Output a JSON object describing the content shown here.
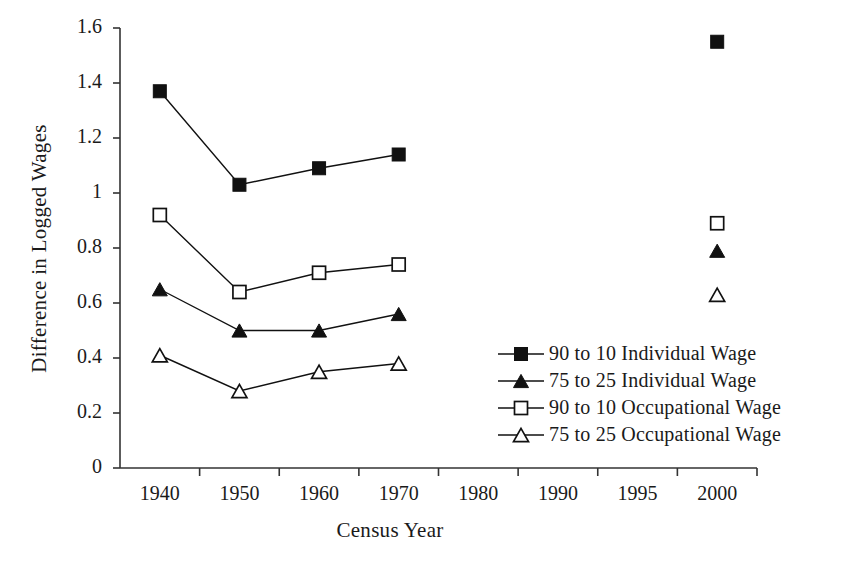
{
  "chart_data": {
    "type": "line",
    "title": "",
    "xlabel": "Census Year",
    "ylabel": "Difference in Logged Wages",
    "categories": [
      "1940",
      "1950",
      "1960",
      "1970",
      "1980",
      "1990",
      "1995",
      "2000"
    ],
    "ylim": [
      0,
      1.6
    ],
    "yticks": [
      "0",
      "0.2",
      "0.4",
      "0.6",
      "0.8",
      "1",
      "1.2",
      "1.4",
      "1.6"
    ],
    "ytick_values": [
      0,
      0.2,
      0.4,
      0.6,
      0.8,
      1.0,
      1.2,
      1.4,
      1.6
    ],
    "grid": false,
    "legend_position": "inside-right-lower",
    "series": [
      {
        "name": "90 to 10 Individual Wage",
        "marker": "filled-square",
        "color": "#111111",
        "x": [
          "1940",
          "1950",
          "1960",
          "1970",
          "2000"
        ],
        "values": [
          1.37,
          1.03,
          1.09,
          1.14,
          1.55
        ],
        "connected_through": [
          "1940",
          "1950",
          "1960",
          "1970"
        ]
      },
      {
        "name": "75 to 25 Individual Wage",
        "marker": "filled-triangle",
        "color": "#111111",
        "x": [
          "1940",
          "1950",
          "1960",
          "1970",
          "2000"
        ],
        "values": [
          0.65,
          0.5,
          0.5,
          0.56,
          0.79
        ],
        "connected_through": [
          "1940",
          "1950",
          "1960",
          "1970"
        ]
      },
      {
        "name": "90 to 10 Occupational Wage",
        "marker": "open-square",
        "color": "#111111",
        "x": [
          "1940",
          "1950",
          "1960",
          "1970",
          "2000"
        ],
        "values": [
          0.92,
          0.64,
          0.71,
          0.74,
          0.89
        ],
        "connected_through": [
          "1940",
          "1950",
          "1960",
          "1970"
        ]
      },
      {
        "name": "75 to 25 Occupational Wage",
        "marker": "open-triangle",
        "color": "#111111",
        "x": [
          "1940",
          "1950",
          "1960",
          "1970",
          "2000"
        ],
        "values": [
          0.41,
          0.28,
          0.35,
          0.38,
          0.63
        ],
        "connected_through": [
          "1940",
          "1950",
          "1960",
          "1970"
        ]
      }
    ],
    "legend": [
      {
        "label": "90 to 10 Individual Wage",
        "marker": "filled-square"
      },
      {
        "label": "75 to 25 Individual Wage",
        "marker": "filled-triangle"
      },
      {
        "label": "90 to 10 Occupational Wage",
        "marker": "open-square"
      },
      {
        "label": "75 to 25 Occupational Wage",
        "marker": "open-triangle"
      }
    ],
    "axis_color": "#333333",
    "background_color": "#ffffff"
  }
}
